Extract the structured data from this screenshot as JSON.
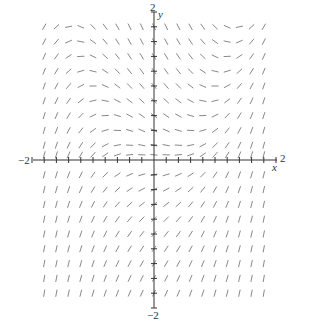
{
  "chart_data": {
    "type": "slope_field",
    "title": "",
    "equation": "dy/dx = x^2 - y",
    "xlabel": "x",
    "ylabel": "y",
    "xlim": [
      -2,
      2
    ],
    "ylim": [
      -2,
      2
    ],
    "x_tick_labels": [
      "-2",
      "2"
    ],
    "y_tick_labels": [
      "2",
      "-2"
    ],
    "grid": false,
    "sample_x": [
      -1.8,
      -1.6,
      -1.4,
      -1.2,
      -1.0,
      -0.8,
      -0.6,
      -0.4,
      -0.2,
      0.0,
      0.2,
      0.4,
      0.6,
      0.8,
      1.0,
      1.2,
      1.4,
      1.6,
      1.8
    ],
    "sample_y": [
      1.8,
      1.6,
      1.4,
      1.2,
      1.0,
      0.8,
      0.6,
      0.4,
      0.2,
      0.07,
      -0.2,
      -0.4,
      -0.6,
      -0.8,
      -1.0,
      -1.2,
      -1.4,
      -1.6,
      -1.8
    ],
    "segment_color": "#888888",
    "axis_color": "#333333"
  },
  "labels": {
    "x_min": "−2",
    "x_max": "2",
    "y_max": "2",
    "y_min": "−2",
    "x_axis": "x",
    "y_axis": "y"
  }
}
